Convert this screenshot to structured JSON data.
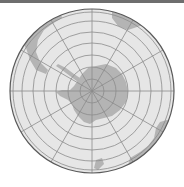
{
  "map": {
    "projection": "south-polar-orthographic",
    "center": "South Pole",
    "features": [
      "Antarctica",
      "South America tip",
      "Australia",
      "New Zealand"
    ],
    "graticule": {
      "meridian_step_deg": 30,
      "parallel_step_deg": 10
    },
    "colors": {
      "ocean": "#e6e6e6",
      "land": "#b4b4b4",
      "graticule": "#8c8c8c",
      "outline": "#5a5a5a",
      "topbar": "#6e6e6e"
    }
  }
}
